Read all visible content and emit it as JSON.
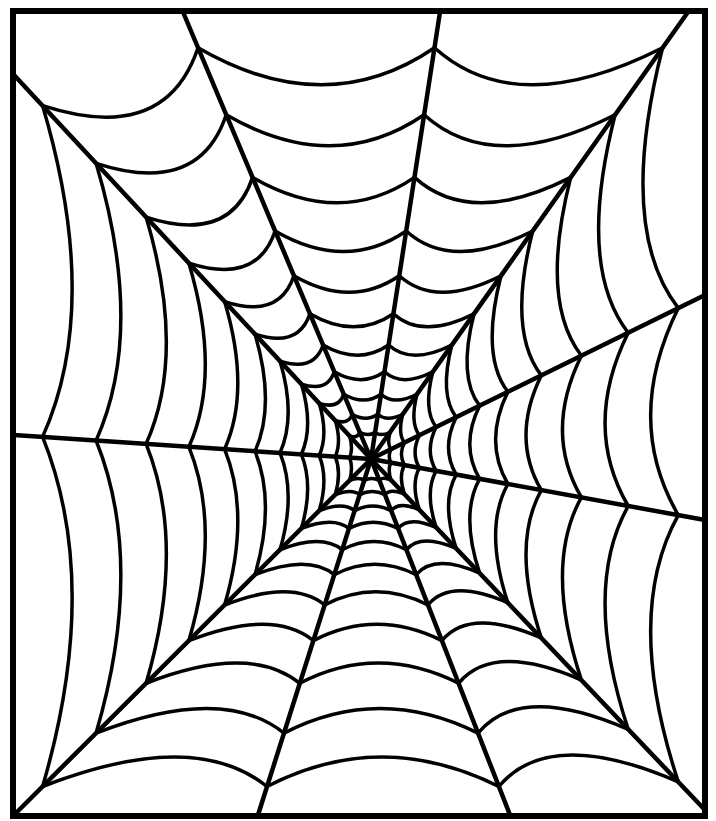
{
  "illustration": {
    "title": "Spider web coloring page",
    "caption": "",
    "colors": {
      "background": "#ffffff",
      "line": "#000000"
    },
    "frame": {
      "x1": 13,
      "y1": 11,
      "x2": 705,
      "y2": 816,
      "stroke_width": 6
    },
    "hub": {
      "x": 371,
      "y": 459
    },
    "spoke_width": 4.5,
    "ring_width": 3.5,
    "spoke_endpoints": [
      [
        183,
        12
      ],
      [
        440,
        12
      ],
      [
        688,
        12
      ],
      [
        705,
        295
      ],
      [
        705,
        520
      ],
      [
        705,
        810
      ],
      [
        510,
        815
      ],
      [
        258,
        815
      ],
      [
        14,
        815
      ],
      [
        14,
        435
      ],
      [
        14,
        75
      ]
    ],
    "ring_fractions": [
      0.06,
      0.1,
      0.145,
      0.195,
      0.255,
      0.325,
      0.41,
      0.51,
      0.63,
      0.77,
      0.92
    ],
    "ring_sag": 0.18
  }
}
